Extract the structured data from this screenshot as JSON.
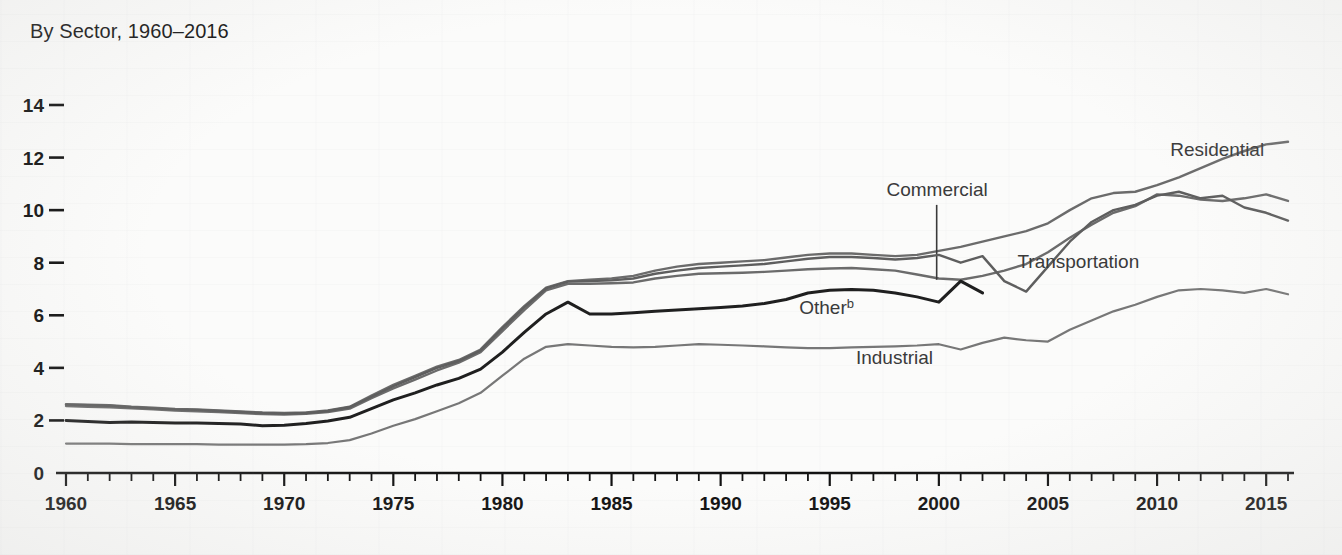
{
  "chart_data": {
    "type": "line",
    "title": "By Sector, 1960–2016",
    "xlabel": "",
    "ylabel": "",
    "xlim": [
      1960,
      2016
    ],
    "ylim": [
      0,
      14
    ],
    "grid": false,
    "legend_position": "inline-labels",
    "y_ticks": [
      "14",
      "12",
      "10",
      "8",
      "6",
      "4",
      "2",
      "0"
    ],
    "y_tick_values": [
      14,
      12,
      10,
      8,
      6,
      4,
      2,
      0
    ],
    "x_ticks": [
      "1960",
      "1965",
      "1970",
      "1975",
      "1980",
      "1985",
      "1990",
      "1995",
      "2000",
      "2005",
      "2010",
      "2015"
    ],
    "x_tick_values": [
      1960,
      1965,
      1970,
      1975,
      1980,
      1985,
      1990,
      1995,
      2000,
      2005,
      2010,
      2015
    ],
    "x_minor_step": 1,
    "series": [
      {
        "name": "Residential",
        "label": "Residential",
        "color": "#6b6b6b",
        "width": 2.4,
        "label_x": 2010.6,
        "label_y": 12.05,
        "x": [
          1960,
          1961,
          1962,
          1963,
          1964,
          1965,
          1966,
          1967,
          1968,
          1969,
          1970,
          1971,
          1972,
          1973,
          1974,
          1975,
          1976,
          1977,
          1978,
          1979,
          1980,
          1981,
          1982,
          1983,
          1984,
          1985,
          1986,
          1987,
          1988,
          1989,
          1990,
          1991,
          1992,
          1993,
          1994,
          1995,
          1996,
          1997,
          1998,
          1999,
          2000,
          2001,
          2002,
          2003,
          2004,
          2005,
          2006,
          2007,
          2008,
          2009,
          2010,
          2011,
          2012,
          2013,
          2014,
          2015,
          2016
        ],
        "y": [
          2.62,
          2.6,
          2.58,
          2.52,
          2.48,
          2.44,
          2.42,
          2.38,
          2.34,
          2.3,
          2.28,
          2.3,
          2.38,
          2.52,
          2.95,
          3.35,
          3.7,
          4.05,
          4.3,
          4.7,
          5.55,
          6.35,
          7.05,
          7.3,
          7.35,
          7.4,
          7.5,
          7.7,
          7.85,
          7.95,
          8.0,
          8.05,
          8.1,
          8.2,
          8.3,
          8.35,
          8.35,
          8.3,
          8.25,
          8.3,
          8.45,
          8.6,
          8.8,
          9.0,
          9.2,
          9.5,
          10.0,
          10.45,
          10.65,
          10.7,
          10.95,
          11.25,
          11.6,
          11.95,
          12.25,
          12.5,
          12.6
        ]
      },
      {
        "name": "Commercial",
        "label": "Commercial",
        "color": "#6b6b6b",
        "width": 2.4,
        "label_x": 1997.6,
        "label_y": 10.55,
        "leader_x": 1999.9,
        "leader_y_top": 10.2,
        "leader_y_bottom": 7.35,
        "x": [
          1960,
          1961,
          1962,
          1963,
          1964,
          1965,
          1966,
          1967,
          1968,
          1969,
          1970,
          1971,
          1972,
          1973,
          1974,
          1975,
          1976,
          1977,
          1978,
          1979,
          1980,
          1981,
          1982,
          1983,
          1984,
          1985,
          1986,
          1987,
          1988,
          1989,
          1990,
          1991,
          1992,
          1993,
          1994,
          1995,
          1996,
          1997,
          1998,
          1999,
          2000,
          2001,
          2002,
          2003,
          2004,
          2005,
          2006,
          2007,
          2008,
          2009,
          2010,
          2011,
          2012,
          2013,
          2014,
          2015,
          2016
        ],
        "y": [
          2.55,
          2.52,
          2.5,
          2.46,
          2.42,
          2.38,
          2.35,
          2.32,
          2.28,
          2.24,
          2.22,
          2.25,
          2.32,
          2.45,
          2.85,
          3.22,
          3.55,
          3.9,
          4.2,
          4.6,
          5.4,
          6.2,
          6.95,
          7.2,
          7.2,
          7.22,
          7.25,
          7.4,
          7.5,
          7.58,
          7.6,
          7.62,
          7.65,
          7.7,
          7.75,
          7.78,
          7.8,
          7.75,
          7.7,
          7.55,
          7.4,
          7.35,
          7.5,
          7.7,
          7.95,
          8.4,
          8.95,
          9.45,
          9.9,
          10.15,
          10.6,
          10.55,
          10.4,
          10.35,
          10.45,
          10.6,
          10.35
        ]
      },
      {
        "name": "Transportation",
        "label": "Transportation",
        "color": "#5e5e5e",
        "width": 2.4,
        "label_x": 2003.6,
        "label_y": 7.8,
        "x": [
          1960,
          1961,
          1962,
          1963,
          1964,
          1965,
          1966,
          1967,
          1968,
          1969,
          1970,
          1971,
          1972,
          1973,
          1974,
          1975,
          1976,
          1977,
          1978,
          1979,
          1980,
          1981,
          1982,
          1983,
          1984,
          1985,
          1986,
          1987,
          1988,
          1989,
          1990,
          1991,
          1992,
          1993,
          1994,
          1995,
          1996,
          1997,
          1998,
          1999,
          2000,
          2001,
          2002,
          2003,
          2004,
          2005,
          2006,
          2007,
          2008,
          2009,
          2010,
          2011,
          2012,
          2013,
          2014,
          2015,
          2016
        ],
        "y": [
          2.6,
          2.58,
          2.56,
          2.5,
          2.46,
          2.42,
          2.4,
          2.36,
          2.32,
          2.28,
          2.26,
          2.28,
          2.36,
          2.5,
          2.9,
          3.3,
          3.65,
          4.0,
          4.26,
          4.66,
          5.5,
          6.3,
          7.02,
          7.28,
          7.3,
          7.33,
          7.4,
          7.58,
          7.7,
          7.8,
          7.85,
          7.9,
          7.95,
          8.05,
          8.15,
          8.22,
          8.22,
          8.18,
          8.12,
          8.18,
          8.3,
          8.0,
          8.25,
          7.3,
          6.9,
          7.85,
          8.8,
          9.55,
          10.0,
          10.2,
          10.55,
          10.7,
          10.45,
          10.55,
          10.1,
          9.9,
          9.6
        ]
      },
      {
        "name": "Industrial",
        "label": "Industrial",
        "color": "#777777",
        "width": 2.2,
        "label_x": 1996.2,
        "label_y": 4.15,
        "x": [
          1960,
          1961,
          1962,
          1963,
          1964,
          1965,
          1966,
          1967,
          1968,
          1969,
          1970,
          1971,
          1972,
          1973,
          1974,
          1975,
          1976,
          1977,
          1978,
          1979,
          1980,
          1981,
          1982,
          1983,
          1984,
          1985,
          1986,
          1987,
          1988,
          1989,
          1990,
          1991,
          1992,
          1993,
          1994,
          1995,
          1996,
          1997,
          1998,
          1999,
          2000,
          2001,
          2002,
          2003,
          2004,
          2005,
          2006,
          2007,
          2008,
          2009,
          2010,
          2011,
          2012,
          2013,
          2014,
          2015,
          2016
        ],
        "y": [
          1.12,
          1.12,
          1.12,
          1.1,
          1.1,
          1.1,
          1.1,
          1.08,
          1.08,
          1.08,
          1.08,
          1.1,
          1.14,
          1.25,
          1.5,
          1.8,
          2.05,
          2.35,
          2.65,
          3.05,
          3.7,
          4.35,
          4.8,
          4.9,
          4.85,
          4.8,
          4.78,
          4.8,
          4.85,
          4.9,
          4.88,
          4.85,
          4.82,
          4.78,
          4.75,
          4.75,
          4.78,
          4.8,
          4.82,
          4.85,
          4.9,
          4.7,
          4.95,
          5.15,
          5.05,
          5.0,
          5.45,
          5.8,
          6.15,
          6.4,
          6.7,
          6.95,
          7.0,
          6.95,
          6.85,
          7.0,
          6.8
        ]
      },
      {
        "name": "Other",
        "label": "Other",
        "superscript": "b",
        "color": "#1f1f1f",
        "width": 3.0,
        "label_x": 1993.6,
        "label_y": 6.05,
        "x": [
          1960,
          1961,
          1962,
          1963,
          1964,
          1965,
          1966,
          1967,
          1968,
          1969,
          1970,
          1971,
          1972,
          1973,
          1974,
          1975,
          1976,
          1977,
          1978,
          1979,
          1980,
          1981,
          1982,
          1983,
          1984,
          1985,
          1986,
          1987,
          1988,
          1989,
          1990,
          1991,
          1992,
          1993,
          1994,
          1995,
          1996,
          1997,
          1998,
          1999,
          2000,
          2001,
          2002
        ],
        "y": [
          2.0,
          1.96,
          1.92,
          1.94,
          1.92,
          1.9,
          1.9,
          1.88,
          1.86,
          1.8,
          1.82,
          1.88,
          1.98,
          2.12,
          2.45,
          2.78,
          3.05,
          3.35,
          3.6,
          3.95,
          4.6,
          5.35,
          6.05,
          6.5,
          6.05,
          6.05,
          6.1,
          6.15,
          6.2,
          6.25,
          6.3,
          6.35,
          6.45,
          6.6,
          6.85,
          6.95,
          6.98,
          6.95,
          6.85,
          6.7,
          6.5,
          7.3,
          6.85
        ]
      }
    ]
  }
}
